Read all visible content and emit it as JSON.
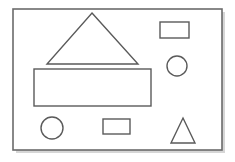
{
  "figure": {
    "kind": "geometric-shapes-diagram",
    "title": "",
    "caption": "",
    "background_color": "#ffffff",
    "frame": {
      "name": "canvas-frame",
      "x": 13,
      "y": 9,
      "width": 209,
      "height": 141,
      "fill_color": "#ffffff",
      "stroke_color": "#6b6b6b",
      "stroke_width": 1.6,
      "shadow_color": "#b4b4b4",
      "shadow_offset_x": 3,
      "shadow_offset_y": 3
    },
    "shape_style": {
      "fill_color": "#ffffff",
      "stroke_color": "#5a5a5a",
      "stroke_width": 1.4
    },
    "shape_count": 7,
    "shapes": [
      {
        "id": "shape-1",
        "label": "large-triangle",
        "type": "triangle",
        "apex_x": 92,
        "apex_y": 13,
        "base_left_x": 47,
        "base_right_x": 138,
        "base_y": 64,
        "width": 91,
        "height": 51
      },
      {
        "id": "shape-2",
        "label": "large-rectangle",
        "type": "rectangle",
        "x": 34,
        "y": 69,
        "width": 117,
        "height": 37
      },
      {
        "id": "shape-3",
        "label": "small-rectangle-top-right",
        "type": "rectangle",
        "x": 160,
        "y": 22,
        "width": 29,
        "height": 16
      },
      {
        "id": "shape-4",
        "label": "circle-right",
        "type": "circle",
        "center_x": 177,
        "center_y": 66,
        "radius": 10
      },
      {
        "id": "shape-5",
        "label": "circle-bottom-left",
        "type": "circle",
        "center_x": 52,
        "center_y": 128,
        "radius": 11
      },
      {
        "id": "shape-6",
        "label": "small-rectangle-bottom-center",
        "type": "rectangle",
        "x": 103,
        "y": 119,
        "width": 27,
        "height": 15
      },
      {
        "id": "shape-7",
        "label": "small-triangle-bottom-right",
        "type": "triangle",
        "apex_x": 183,
        "apex_y": 118,
        "base_left_x": 171,
        "base_right_x": 195,
        "base_y": 143,
        "width": 24,
        "height": 25
      }
    ]
  }
}
